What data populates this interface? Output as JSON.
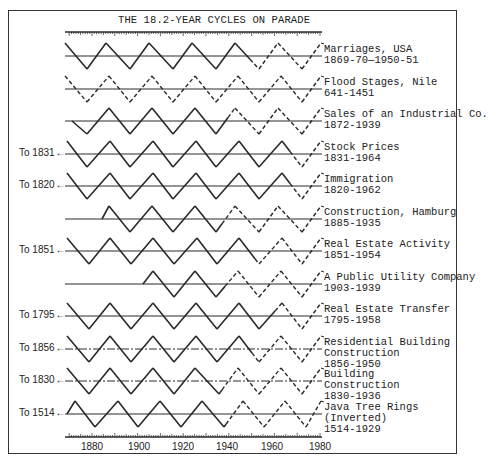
{
  "chart_data": {
    "type": "line",
    "title": "THE 18.2-YEAR CYCLES ON PARADE",
    "xlabel": "",
    "ylabel": "",
    "xlim": [
      1870,
      1980
    ],
    "x_ticks": [
      "1880",
      "1900",
      "1920",
      "1940",
      "1960",
      "1980"
    ],
    "cycle_length_years": 18.2,
    "grid": false,
    "legend_position": "right (inline labels per row)",
    "series": [
      {
        "name": "Marriages, USA",
        "years": "1869-70—1950-51",
        "extends_to": null,
        "center_y": 56,
        "vertices_x": [
          65,
          87,
          106,
          130,
          149,
          173,
          192,
          216,
          235,
          259,
          278,
          302,
          321
        ],
        "first": "high",
        "dash_from_x": 250,
        "flat_until_x": null,
        "centerline_style": "solid",
        "all_dashed": false
      },
      {
        "name": "Flood Stages, Nile",
        "years": "641-1451",
        "extends_to": null,
        "center_y": 89,
        "vertices_x": [
          65,
          87,
          109,
          130,
          152,
          173,
          195,
          216,
          238,
          259,
          281,
          302,
          321
        ],
        "first": "high",
        "dash_from_x": 65,
        "flat_until_x": null,
        "centerline_style": "solid",
        "all_dashed": true
      },
      {
        "name": "Sales of an Industrial Co.",
        "years": "1872-1939",
        "extends_to": null,
        "center_y": 121,
        "vertices_x": [
          72,
          87,
          109,
          130,
          152,
          173,
          195,
          216,
          235,
          259,
          278,
          302,
          321
        ],
        "first": "mid",
        "dash_from_x": 228,
        "flat_until_x": null,
        "centerline_style": "solid",
        "all_dashed": false
      },
      {
        "name": "Stock Prices",
        "years": "1831-1964",
        "extends_to": "To 1831",
        "center_y": 154,
        "vertices_x": [
          67,
          87,
          110,
          130,
          153,
          173,
          196,
          216,
          239,
          259,
          282,
          302,
          321
        ],
        "first": "high",
        "dash_from_x": 290,
        "flat_until_x": null,
        "centerline_style": "solid",
        "all_dashed": false
      },
      {
        "name": "Immigration",
        "years": "1820-1962",
        "extends_to": "To 1820",
        "center_y": 186,
        "vertices_x": [
          67,
          87,
          110,
          130,
          153,
          173,
          196,
          216,
          239,
          259,
          282,
          302,
          321
        ],
        "first": "high",
        "dash_from_x": 290,
        "flat_until_x": null,
        "centerline_style": "solid",
        "all_dashed": false
      },
      {
        "name": "Construction, Hamburg",
        "years": "1885-1935",
        "extends_to": null,
        "center_y": 219,
        "vertices_x": [
          102,
          109,
          130,
          152,
          173,
          195,
          216,
          235,
          259,
          278,
          302,
          321
        ],
        "first": "mid-rise",
        "dash_from_x": 222,
        "flat_until_x": 102,
        "centerline_style": "solid",
        "all_dashed": false
      },
      {
        "name": "Real Estate Activity",
        "years": "1851-1954",
        "extends_to": "To 1851",
        "center_y": 251,
        "vertices_x": [
          67,
          89,
          110,
          131,
          153,
          174,
          197,
          217,
          239,
          259,
          282,
          302,
          321
        ],
        "first": "high",
        "dash_from_x": 255,
        "flat_until_x": null,
        "centerline_style": "solid",
        "all_dashed": false
      },
      {
        "name": "A Public Utility Company",
        "years": "1903-1939",
        "extends_to": null,
        "center_y": 284,
        "vertices_x": [
          143,
          153,
          174,
          195,
          216,
          238,
          259,
          281,
          302,
          321
        ],
        "first": "mid-rise",
        "dash_from_x": 225,
        "flat_until_x": 143,
        "centerline_style": "solid",
        "all_dashed": false
      },
      {
        "name": "Real Estate Transfer",
        "years": "1795-1958",
        "extends_to": "To 1795",
        "center_y": 316,
        "vertices_x": [
          67,
          89,
          110,
          131,
          153,
          174,
          196,
          217,
          239,
          259,
          282,
          302,
          321
        ],
        "first": "high",
        "dash_from_x": 275,
        "flat_until_x": null,
        "centerline_style": "solid",
        "all_dashed": false
      },
      {
        "name": "Residential Building\nConstruction",
        "years": "1856-1950",
        "extends_to": "To 1856",
        "center_y": 349,
        "vertices_x": [
          67,
          89,
          110,
          131,
          153,
          174,
          196,
          217,
          239,
          259,
          281,
          302,
          321
        ],
        "first": "high",
        "dash_from_x": 252,
        "flat_until_x": null,
        "centerline_style": "dashdot",
        "all_dashed": false
      },
      {
        "name": "Building\nConstruction",
        "years": "1830-1936",
        "extends_to": "To 1830",
        "center_y": 381,
        "vertices_x": [
          67,
          89,
          110,
          131,
          153,
          174,
          195,
          219,
          238,
          259,
          281,
          302,
          321
        ],
        "first": "high",
        "dash_from_x": 222,
        "flat_until_x": null,
        "centerline_style": "dashdot",
        "all_dashed": false
      },
      {
        "name": "Java Tree Rings\n(Inverted)",
        "years": "1514-1929",
        "extends_to": "To 1514",
        "center_y": 414,
        "vertices_x": [
          67,
          75,
          95,
          118,
          138,
          160,
          181,
          202,
          224,
          243,
          264,
          285,
          306,
          321
        ],
        "first": "mid-rise",
        "dash_from_x": 226,
        "flat_until_x": null,
        "centerline_style": "solid",
        "all_dashed": false
      }
    ]
  },
  "page": {
    "title": "THE 18.2-YEAR CYCLES ON PARADE",
    "axis_labels": [
      "1880",
      "1900",
      "1920",
      "1940",
      "1960",
      "1980"
    ],
    "axis_label_x": [
      92,
      139,
      183,
      227,
      272,
      320
    ],
    "row_labels": [
      {
        "name": "Marriages, USA",
        "years": "1869-70—1950-51"
      },
      {
        "name": "Flood Stages, Nile",
        "years": "641-1451"
      },
      {
        "name": "Sales of an Industrial Co.",
        "years": "1872-1939"
      },
      {
        "name": "Stock Prices",
        "years": "1831-1964"
      },
      {
        "name": "Immigration",
        "years": "1820-1962"
      },
      {
        "name": "Construction, Hamburg",
        "years": "1885-1935"
      },
      {
        "name": "Real Estate Activity",
        "years": "1851-1954"
      },
      {
        "name": "A Public Utility Company",
        "years": "1903-1939"
      },
      {
        "name": "Real Estate Transfer",
        "years": "1795-1958"
      },
      {
        "name": "Residential Building\nConstruction",
        "years": "1856-1950"
      },
      {
        "name": "Building\nConstruction",
        "years": "1830-1936"
      },
      {
        "name": "Java Tree Rings\n(Inverted)",
        "years": "1514-1929"
      }
    ],
    "to_labels": [
      {
        "text": "To 1831",
        "row": 3
      },
      {
        "text": "To 1820",
        "row": 4
      },
      {
        "text": "To 1851",
        "row": 6
      },
      {
        "text": "To 1795",
        "row": 8
      },
      {
        "text": "To 1856",
        "row": 9
      },
      {
        "text": "To 1830",
        "row": 10
      },
      {
        "text": "To 1514",
        "row": 11
      }
    ],
    "arrow_glyph": "←"
  }
}
